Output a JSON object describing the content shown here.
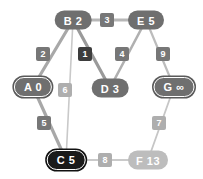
{
  "diagram": {
    "nodes": [
      {
        "id": "B",
        "label": "B 2",
        "x": 73,
        "y": 20,
        "style": "plain"
      },
      {
        "id": "E",
        "label": "E 5",
        "x": 146,
        "y": 20,
        "style": "plain"
      },
      {
        "id": "A",
        "label": "A 0",
        "x": 33,
        "y": 87,
        "style": "ring"
      },
      {
        "id": "D",
        "label": "D 3",
        "x": 110,
        "y": 88,
        "style": "plain"
      },
      {
        "id": "G",
        "label": "G ∞",
        "x": 174,
        "y": 87,
        "style": "ring"
      },
      {
        "id": "C",
        "label": "C 5",
        "x": 66,
        "y": 160,
        "style": "ring-dark"
      },
      {
        "id": "F",
        "label": "F 13",
        "x": 148,
        "y": 160,
        "style": "light"
      }
    ],
    "edges": [
      {
        "from": "B",
        "to": "E",
        "weight": "3",
        "lx": 107,
        "ly": 20,
        "tone": "mid",
        "stroke": "#b7b7b7",
        "width": 3.2
      },
      {
        "from": "B",
        "to": "A",
        "weight": "2",
        "lx": 43,
        "ly": 54,
        "tone": "mid",
        "stroke": "#a8a8a8",
        "width": 3.2
      },
      {
        "from": "B",
        "to": "D",
        "weight": "1",
        "lx": 85,
        "ly": 54,
        "tone": "dark",
        "stroke": "#9a9a9a",
        "width": 3.2
      },
      {
        "from": "B",
        "to": "C",
        "weight": "6",
        "lx": 65,
        "ly": 90,
        "tone": "light",
        "stroke": "#c9c9c9",
        "width": 1.6
      },
      {
        "from": "E",
        "to": "D",
        "weight": "4",
        "lx": 122,
        "ly": 54,
        "tone": "mid",
        "stroke": "#b0b0b0",
        "width": 2.6
      },
      {
        "from": "E",
        "to": "G",
        "weight": "9",
        "lx": 163,
        "ly": 54,
        "tone": "mid",
        "stroke": "#bcbcbc",
        "width": 2.2
      },
      {
        "from": "A",
        "to": "C",
        "weight": "5",
        "lx": 44,
        "ly": 123,
        "tone": "mid",
        "stroke": "#a8a8a8",
        "width": 3.2
      },
      {
        "from": "G",
        "to": "F",
        "weight": "7",
        "lx": 159,
        "ly": 123,
        "tone": "light",
        "stroke": "#c6c6c6",
        "width": 1.8
      },
      {
        "from": "C",
        "to": "F",
        "weight": "8",
        "lx": 105,
        "ly": 160,
        "tone": "light",
        "stroke": "#cacaca",
        "width": 1.8
      }
    ]
  }
}
